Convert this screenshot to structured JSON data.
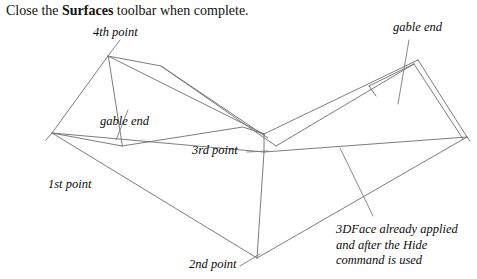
{
  "document": {
    "instruction": {
      "prefix": "Close the ",
      "emphasis": "Surfaces",
      "suffix": " toolbar when complete."
    }
  },
  "diagram": {
    "name": "L-shaped gable roof 3DFace wireframe",
    "stroke_color": "#6d6d72",
    "background_color": "#ffffff",
    "labels": {
      "fourth_point": "4th point",
      "third_point": "3rd point",
      "second_point": "2nd point",
      "first_point": "1st point",
      "gable_end_left": "gable end",
      "gable_end_right": "gable end"
    },
    "note": {
      "line1": "3DFace already applied",
      "line2": "and after the Hide",
      "line3": "command is used"
    },
    "vertices": {
      "apex_left": [
        108,
        56
      ],
      "ridge_left_end": [
        161,
        66
      ],
      "corner_first_point": [
        52,
        133
      ],
      "inner_ridge_junction": [
        264,
        134
      ],
      "corner_third_point": [
        264,
        152
      ],
      "corner_second_point": [
        257,
        258
      ],
      "apex_right": [
        418,
        60
      ],
      "corner_right_far": [
        467,
        137
      ],
      "eave_left_mid": [
        243,
        127
      ]
    }
  }
}
